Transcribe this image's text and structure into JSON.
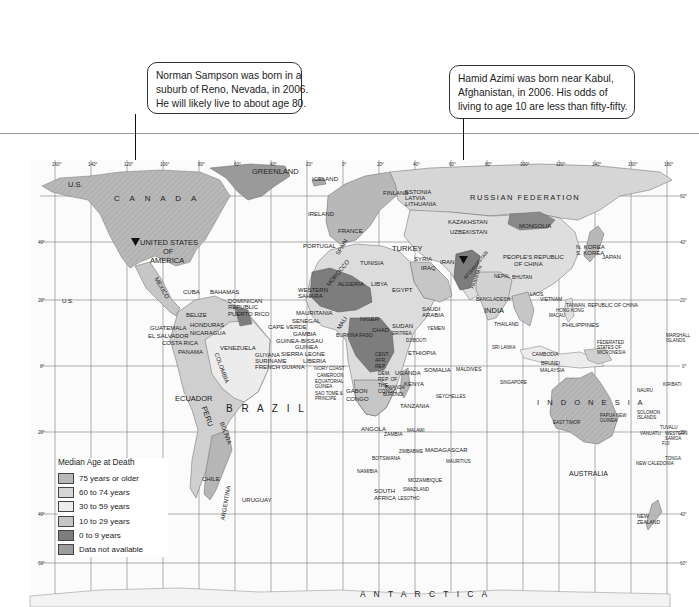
{
  "callouts": [
    {
      "id": "norman",
      "lines": [
        "Norman Sampson was born in a",
        "suburb of Reno, Nevada, in 2006.",
        "He will likely live to about age 80."
      ],
      "points_to": "UNITED STATES OF AMERICA"
    },
    {
      "id": "hamid",
      "lines": [
        "Hamid Azimi was born near Kabul,",
        "Afghanistan, in 2006. His odds of",
        "living to age 10 are less than fifty-fifty."
      ],
      "points_to": "AFGHANISTAN"
    }
  ],
  "legend": {
    "title": "Median Age at Death",
    "items": [
      {
        "label": "75 years or older",
        "color": "#b9b9b9"
      },
      {
        "label": "60 to 74 years",
        "color": "#d6d6d6"
      },
      {
        "label": "30 to 59 years",
        "color": "#ececec"
      },
      {
        "label": "10 to 29 years",
        "color": "#c6c6c6"
      },
      {
        "label": "0 to 9 years",
        "color": "#7d7d7d"
      },
      {
        "label": "Data not available",
        "color": "#9c9c9c"
      }
    ]
  },
  "map": {
    "longitude_ticks": [
      "160°",
      "140°",
      "120°",
      "100°",
      "80°",
      "60°",
      "40°",
      "20°",
      "0°",
      "20°",
      "40°",
      "60°",
      "80°",
      "100°",
      "120°",
      "140°",
      "160°",
      "180°"
    ],
    "latitude_ticks": [
      "60°",
      "40°",
      "20°",
      "0°",
      "20°",
      "40°",
      "60°"
    ],
    "region_labels": {
      "us": "U.S.",
      "canada": "C A N A D A",
      "greenland": "GREENLAND",
      "iceland": "ICELAND",
      "usa_1": "UNITED STATES",
      "usa_2": "OF",
      "usa_3": "AMERICA",
      "mexico": "MEXICO",
      "cuba": "CUBA",
      "bahamas": "BAHAMAS",
      "dominican": "DOMINICAN REPUBLIC",
      "puerto_rico": "PUERTO RICO",
      "jamaica": "JAMAICA",
      "belize": "BELIZE",
      "honduras": "HONDURAS",
      "guatemala": "GUATEMALA",
      "el_salvador": "EL SALVADOR",
      "nicaragua": "NICARAGUA",
      "costa_rica": "COSTA RICA",
      "panama": "PANAMA",
      "venezuela": "VENEZUELA",
      "guyana": "GUYANA",
      "suriname": "SURINAME",
      "french_guiana": "FRENCH GUIANA",
      "colombia": "COLOMBIA",
      "ecuador": "ECUADOR",
      "peru": "PERU",
      "brazil": "B R A Z I L",
      "bolivia": "BOLIVIA",
      "chile": "CHILE",
      "argentina": "ARGENTINA",
      "uruguay": "URUGUAY",
      "us_hawaii": "U.S.",
      "russia": "RUSSIAN  FEDERATION",
      "mongolia": "MONGOLIA",
      "china_1": "PEOPLE'S REPUBLIC",
      "china_2": "OF CHINA",
      "japan": "JAPAN",
      "n_korea": "N. KOREA",
      "s_korea": "S. KOREA",
      "portugal": "PORTUGAL",
      "ireland": "IRELAND",
      "turkey": "TURKEY",
      "iran": "IRAN",
      "iraq": "IRAQ",
      "syria": "SYRIA",
      "egypt": "EGYPT",
      "libya": "LIBYA",
      "algeria": "ALGERIA",
      "tunisia": "TUNISIA",
      "morocco": "MOROCCO",
      "western_sahara": "WESTERN SAHARA",
      "mauritania": "MAURITANIA",
      "mali": "MALI",
      "niger": "NIGER",
      "chad": "CHAD",
      "sudan": "SUDAN",
      "senegal": "SENEGAL",
      "cape_verde": "CAPE VERDE",
      "gambia": "GAMBIA",
      "guinea_bissau": "GUINEA-BISSAU",
      "guinea": "GUINEA",
      "sierra_leone": "SIERRA LEONE",
      "liberia": "LIBERIA",
      "ethiopia": "ETHIOPIA",
      "somalia": "SOMALIA",
      "kenya": "KENYA",
      "uganda": "UGANDA",
      "car": "CENT. AFR. REP.",
      "drc": "DEM. REP. OF THE CONGO",
      "gabon": "GABON",
      "congo": "CONGO",
      "cameroon": "CAMEROON",
      "eq_guinea": "EQUATORIAL GUINEA",
      "sao_tome": "SAO TOME & PRINCIPE",
      "tanzania": "TANZANIA",
      "angola": "ANGOLA",
      "zambia": "ZAMBIA",
      "malawi": "MALAWI",
      "zimbabwe": "ZIMBABWE",
      "botswana": "BOTSWANA",
      "namibia": "NAMIBIA",
      "mozambique": "MOZAMBIQUE",
      "madagascar": "MADAGASCAR",
      "mauritius": "MAURITIUS",
      "south_africa": "SOUTH AFRICA",
      "swaziland": "SWAZILAND",
      "lesotho": "LESOTHO",
      "seychelles": "SEYCHELLES",
      "maldives": "MALDIVES",
      "saudi": "SAUDI ARABIA",
      "yemen": "YEMEN",
      "india": "INDIA",
      "nepal": "NEPAL",
      "bhutan": "BHUTAN",
      "bangladesh": "BANGLADESH",
      "sri_lanka": "SRI LANKA",
      "thailand": "THAILAND",
      "laos": "LAOS",
      "vietnam": "VIETNAM",
      "cambodia": "CAMBODIA",
      "malaysia": "MALAYSIA",
      "brunei": "BRUNEI",
      "singapore": "SINGAPORE",
      "philippines": "PHILIPPINES",
      "taiwan": "TAIWAN, REPUBLIC OF CHINA",
      "hong_kong": "HONG KONG",
      "macau": "MACAU",
      "indonesia": "I N D O N E S I A",
      "east_timor": "EAST TIMOR",
      "png": "PAPUA NEW GUINEA",
      "micronesia": "FEDERATED STATES OF MICRONESIA",
      "marshall": "MARSHALL ISLANDS",
      "kiribati": "KIRIBATI",
      "nauru": "NAURU",
      "solomon": "SOLOMON ISLANDS",
      "tuvalu": "TUVALU",
      "vanuatu": "VANUATU",
      "w_samoa": "WESTERN SAMOA",
      "fiji": "FIJI",
      "tonga": "TONGA",
      "new_caledonia": "NEW CALEDONIA",
      "australia": "AUSTRALIA",
      "nz_1": "NEW",
      "nz_2": "ZEALAND",
      "antarctica": "A N T A R C T I C A",
      "kazakhstan": "KAZAKHSTAN",
      "uzbekistan": "UZBEKISTAN",
      "afghanistan": "AFGHANISTAN",
      "pakistan": "PAKISTAN",
      "finland": "FINLAND",
      "estonia": "ESTONIA",
      "latvia": "LATVIA",
      "lithuania": "LITHUANIA",
      "france": "FRANCE",
      "spain": "SPAIN",
      "ivory_coast": "IVORY COAST",
      "burkina": "BURKINA FASO",
      "djibouti": "DJIBOUTI",
      "eritrea": "ERITREA",
      "rwanda": "RWANDA",
      "burundi": "BURUNDI"
    }
  }
}
